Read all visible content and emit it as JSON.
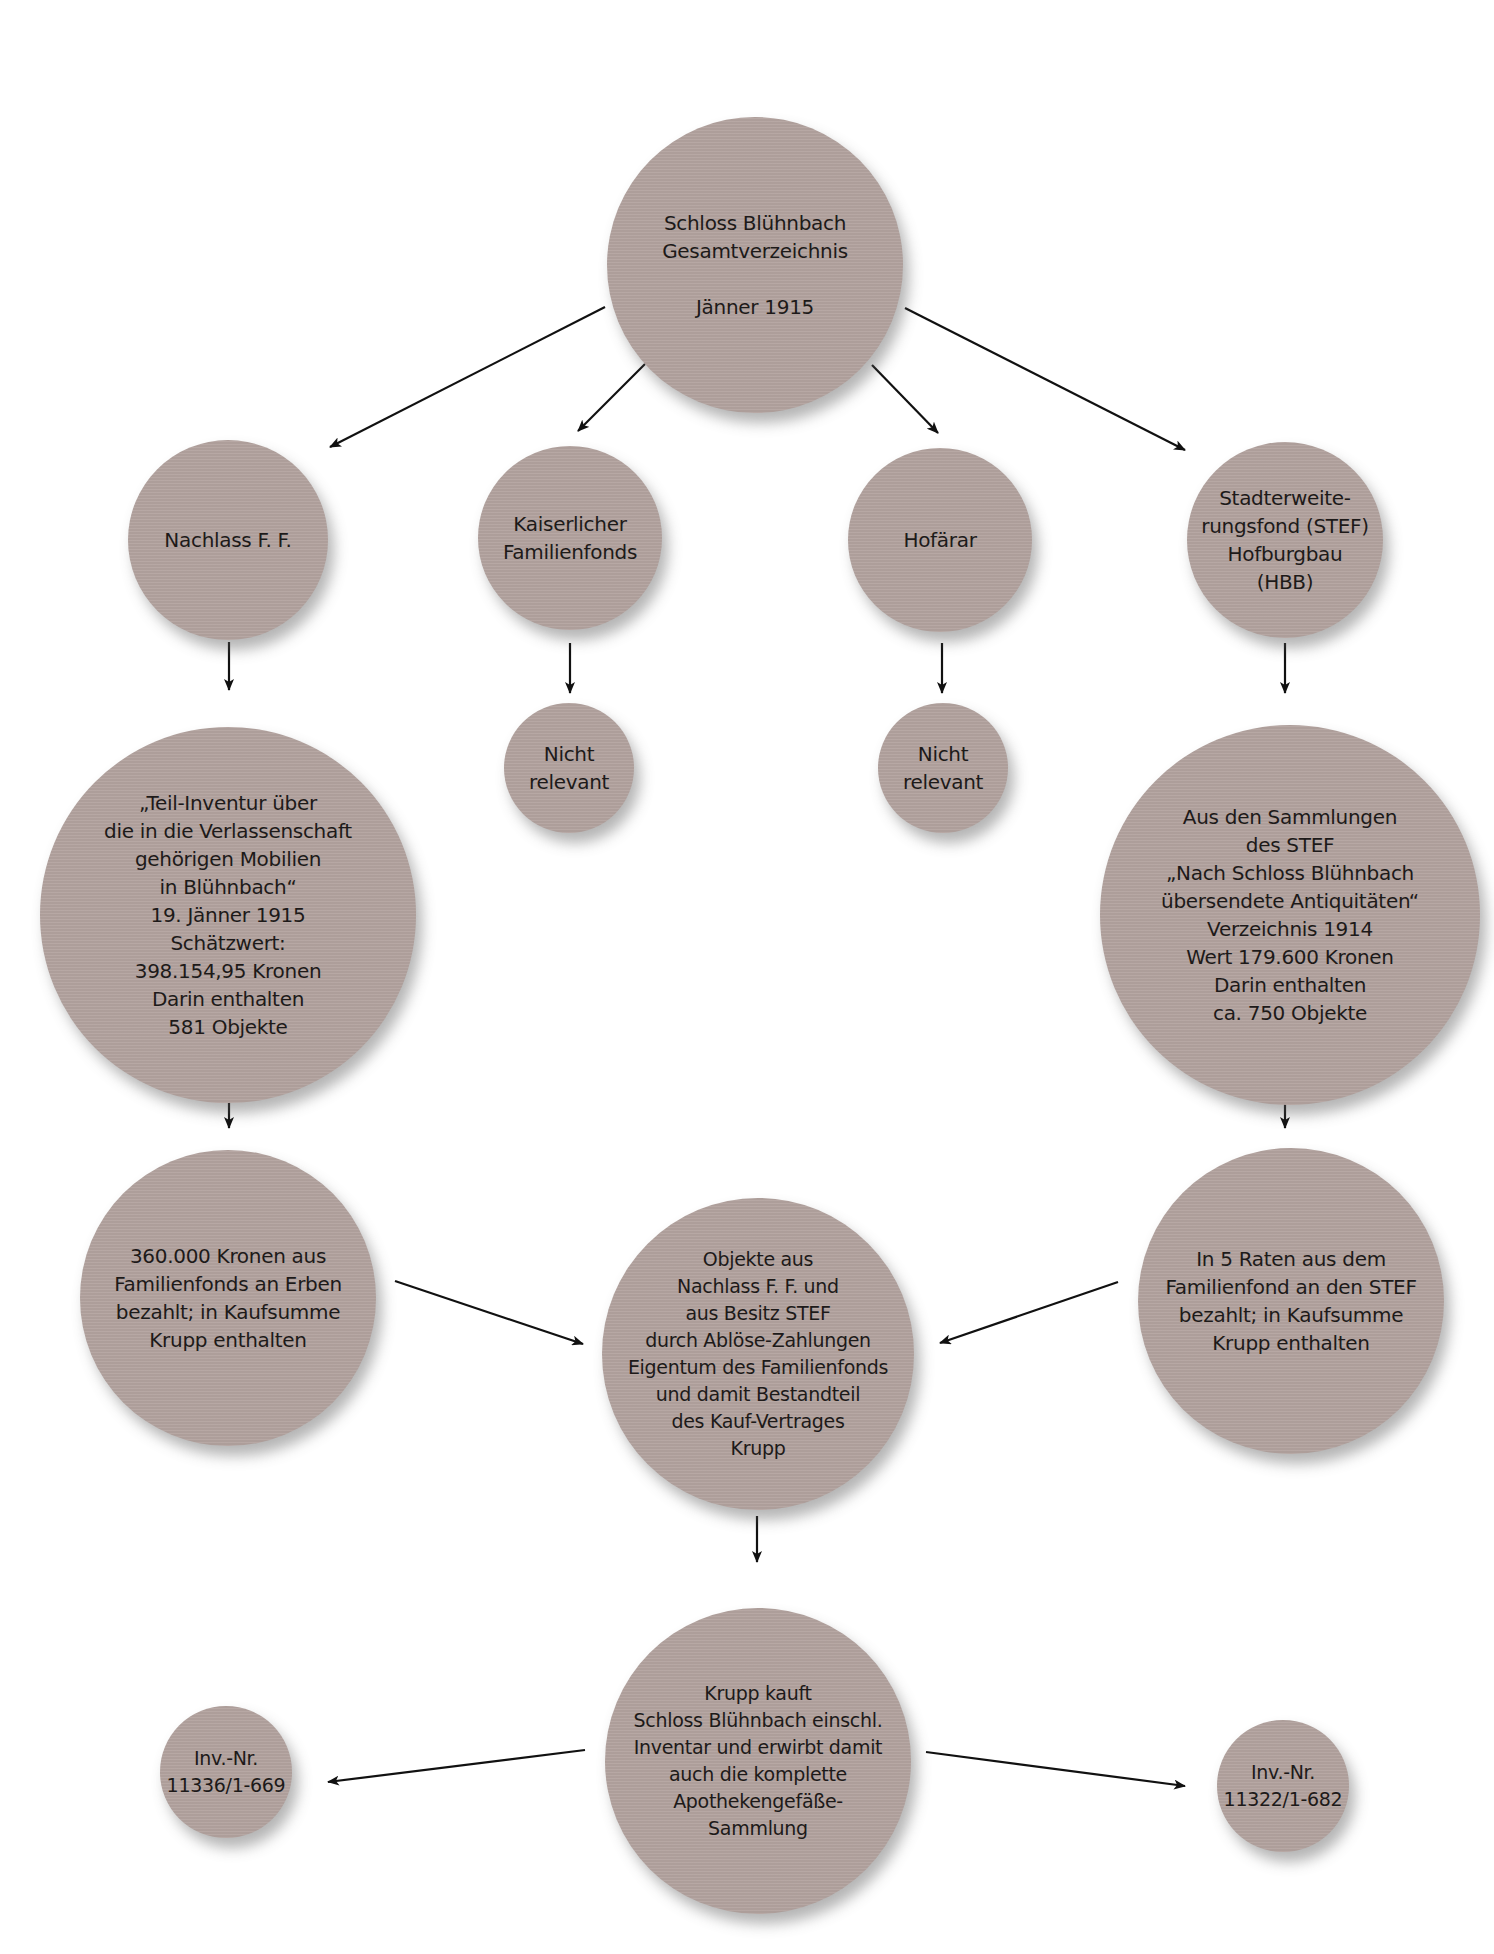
{
  "diagram": {
    "background_color": "#ffffff",
    "node_color": "#b3a39f",
    "text_color": "#1d1a19",
    "arrow_color": "#111111",
    "nodes": {
      "root": {
        "label": "Schloss Blühnbach\nGesamtverzeichnis\n\nJänner 1915"
      },
      "nachlass": {
        "label": "Nachlass F. F."
      },
      "familienfonds": {
        "label": "Kaiserlicher\nFamilienfonds"
      },
      "hofaerar": {
        "label": "Hofärar"
      },
      "stef": {
        "label": "Stadterweite-\nrungsfond (STEF)\nHofburgbau\n(HBB)"
      },
      "nicht_relevant_1": {
        "label": "Nicht\nrelevant"
      },
      "nicht_relevant_2": {
        "label": "Nicht\nrelevant"
      },
      "teil_inventur": {
        "label": "„Teil-Inventur über\ndie in die Verlassenschaft\ngehörigen Mobilien\nin Blühnbach“\n19. Jänner 1915\nSchätzwert:\n398.154,95 Kronen\nDarin enthalten\n581 Objekte"
      },
      "stef_sammlungen": {
        "label": "Aus den Sammlungen\ndes STEF\n„Nach Schloss Blühnbach\nübersendete Antiquitäten“\nVerzeichnis 1914\nWert 179.600 Kronen\nDarin enthalten\nca. 750 Objekte"
      },
      "zahlung_erben": {
        "label": "360.000 Kronen aus\nFamilienfonds an Erben\nbezahlt; in Kaufsumme\nKrupp enthalten"
      },
      "eigentum": {
        "label": "Objekte aus\nNachlass F. F. und\naus Besitz STEF\ndurch Ablöse-Zahlungen\nEigentum des Familienfonds\nund damit Bestandteil\ndes Kauf-Vertrages\nKrupp"
      },
      "zahlung_stef": {
        "label": "In 5 Raten aus dem\nFamilienfond an den STEF\nbezahlt; in Kaufsumme\nKrupp enthalten"
      },
      "krupp": {
        "label": "Krupp kauft\nSchloss Blühnbach einschl.\nInventar und erwirbt damit\nauch die komplette\nApothekengefäße-\nSammlung"
      },
      "inv_left": {
        "label": "Inv.-Nr.\n11336/1-669"
      },
      "inv_right": {
        "label": "Inv.-Nr.\n11322/1-682"
      }
    },
    "edges": [
      {
        "from": "root",
        "to": "nachlass"
      },
      {
        "from": "root",
        "to": "familienfonds"
      },
      {
        "from": "root",
        "to": "hofaerar"
      },
      {
        "from": "root",
        "to": "stef"
      },
      {
        "from": "nachlass",
        "to": "teil_inventur"
      },
      {
        "from": "familienfonds",
        "to": "nicht_relevant_1"
      },
      {
        "from": "hofaerar",
        "to": "nicht_relevant_2"
      },
      {
        "from": "stef",
        "to": "stef_sammlungen"
      },
      {
        "from": "teil_inventur",
        "to": "zahlung_erben"
      },
      {
        "from": "stef_sammlungen",
        "to": "zahlung_stef"
      },
      {
        "from": "zahlung_erben",
        "to": "eigentum"
      },
      {
        "from": "zahlung_stef",
        "to": "eigentum"
      },
      {
        "from": "eigentum",
        "to": "krupp"
      },
      {
        "from": "krupp",
        "to": "inv_left"
      },
      {
        "from": "krupp",
        "to": "inv_right"
      }
    ]
  }
}
